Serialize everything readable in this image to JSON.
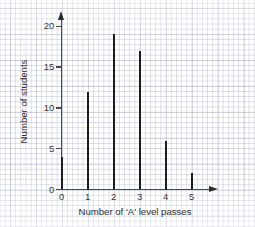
{
  "chart_data": {
    "type": "bar",
    "title": "",
    "xlabel": "Number of 'A' level passes",
    "ylabel": "Number of students",
    "categories": [
      "0",
      "1",
      "2",
      "3",
      "4",
      "5"
    ],
    "values": [
      4,
      12,
      19,
      17,
      6,
      2
    ],
    "x": [
      0,
      1,
      2,
      3,
      4,
      5
    ],
    "xlim": [
      0,
      5
    ],
    "ylim": [
      0,
      21
    ],
    "y_ticks": [
      "0",
      "5",
      "10",
      "15",
      "20"
    ],
    "y_tick_values": [
      0,
      5,
      10,
      15,
      20
    ],
    "x_ticks": [
      "0",
      "1",
      "2",
      "3",
      "4",
      "5"
    ],
    "grid": true,
    "grid_style": "graph-paper",
    "legend": "none",
    "bar_color": "#1c1c1c",
    "axis_color": "#4a4a4a",
    "grid_color": "#b9c0cd"
  },
  "axes": {
    "y_arrow": "arrow-up",
    "x_arrow": "arrow-right"
  }
}
